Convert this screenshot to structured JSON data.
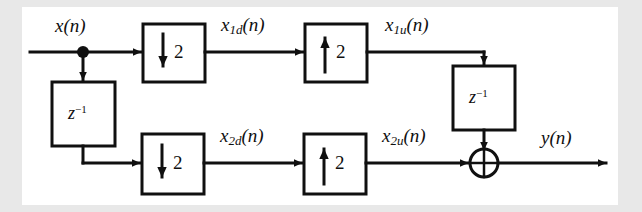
{
  "figure": {
    "frame": {
      "background_color": "#e8e8e8",
      "panel_color": "#ffffff",
      "line_color": "#101010"
    }
  },
  "signals": {
    "input": "x(n)",
    "input_base": "x",
    "input_arg": "(n)",
    "top_decimated_base": "x",
    "top_decimated_sub": "1d",
    "top_decimated_arg": "(n)",
    "top_upsampled_base": "x",
    "top_upsampled_sub": "1u",
    "top_upsampled_arg": "(n)",
    "bottom_decimated_base": "x",
    "bottom_decimated_sub": "2d",
    "bottom_decimated_arg": "(n)",
    "bottom_upsampled_base": "x",
    "bottom_upsampled_sub": "2u",
    "bottom_upsampled_arg": "(n)",
    "output_base": "y",
    "output_arg": "(n)"
  },
  "blocks": [
    {
      "id": "down-top",
      "type": "downsampler",
      "symbol": "down-arrow-icon",
      "factor": "2",
      "label": "downsample by 2"
    },
    {
      "id": "up-top",
      "type": "upsampler",
      "symbol": "up-arrow-icon",
      "factor": "2",
      "label": "upsample by 2"
    },
    {
      "id": "down-bottom",
      "type": "downsampler",
      "symbol": "down-arrow-icon",
      "factor": "2",
      "label": "downsample by 2"
    },
    {
      "id": "up-bottom",
      "type": "upsampler",
      "symbol": "up-arrow-icon",
      "factor": "2",
      "label": "upsample by 2"
    },
    {
      "id": "delay-left",
      "type": "delay",
      "base": "z",
      "exponent": "−1",
      "label": "unit delay"
    },
    {
      "id": "delay-right",
      "type": "delay",
      "base": "z",
      "exponent": "−1",
      "label": "unit delay"
    }
  ],
  "nodes": {
    "split": {
      "id": "split-node",
      "label": "branch node"
    },
    "adder": {
      "id": "sum-node",
      "symbol": "⊕",
      "label": "summing junction"
    }
  }
}
